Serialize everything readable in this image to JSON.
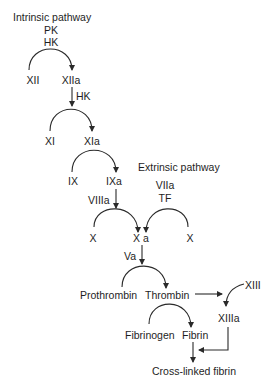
{
  "diagram": {
    "intrinsic": {
      "heading": "Intrinsic pathway",
      "cofactors_top": [
        "PK",
        "HK"
      ],
      "steps": [
        {
          "substrate": "XII",
          "product": "XIIa"
        },
        {
          "cofactor": "HK",
          "substrate": "XI",
          "product": "XIa"
        },
        {
          "substrate": "IX",
          "product": "IXa"
        },
        {
          "cofactor": "VIIIa",
          "substrate": "X",
          "product": "X a"
        }
      ]
    },
    "extrinsic": {
      "heading": "Extrinsic pathway",
      "cofactors": [
        "VIIa",
        "TF"
      ],
      "substrate": "X"
    },
    "common": {
      "cofactor": "Va",
      "prothrombin": "Prothrombin",
      "thrombin": "Thrombin",
      "fibrinogen": "Fibrinogen",
      "fibrin": "Fibrin",
      "xiii": "XIII",
      "xiiia": "XIIIa",
      "crosslinked": "Cross-linked fibrin"
    },
    "colors": {
      "line": "#2a2a2a",
      "text": "#1e1e1e",
      "background": "#ffffff"
    }
  }
}
